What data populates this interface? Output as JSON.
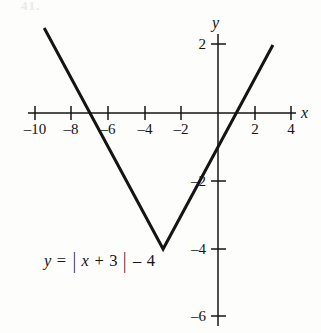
{
  "figure": {
    "background_color": "#fdfdfc",
    "ink_color": "#141414",
    "corner_mark": "41.",
    "width": 321,
    "height": 333
  },
  "axes": {
    "x_axis_name": "x",
    "y_axis_name": "y",
    "x_tick_labels": [
      "–10",
      "–8",
      "–6",
      "–4",
      "–2",
      "2",
      "4"
    ],
    "y_tick_labels": [
      "2",
      "–2",
      "–4",
      "–6"
    ]
  },
  "equation": {
    "lhs": "y",
    "equals": "=",
    "bar_open": "|",
    "inside_var": "x",
    "inside_op": "+",
    "inside_num": "3",
    "bar_close": "|",
    "trailing_op": "–",
    "trailing_num": "4",
    "full_text": "y = |x + 3| – 4"
  },
  "chart_data": {
    "type": "line",
    "title": "",
    "subtitle": "",
    "xlabel": "x",
    "ylabel": "y",
    "function": "y = |x + 3| - 4",
    "xlim": [
      -10.4,
      4.2
    ],
    "ylim": [
      -6.5,
      2.6
    ],
    "xticks": [
      -10,
      -8,
      -6,
      -4,
      -2,
      2,
      4
    ],
    "yticks": [
      2,
      -2,
      -4,
      -6
    ],
    "grid": false,
    "legend_position": "none",
    "annotations": [
      {
        "text": "y = |x + 3| – 4",
        "x": -8.3,
        "y": -4.3
      }
    ],
    "series": [
      {
        "name": "y = |x + 3| - 4",
        "x": [
          -9.5,
          -3,
          3
        ],
        "values": [
          2.5,
          -4,
          2
        ],
        "vertex": {
          "x": -3,
          "y": -4
        },
        "x_intercepts": [
          -7,
          1
        ],
        "y_intercept": -1,
        "slope_left": -1,
        "slope_right": 1,
        "color": "#141414"
      }
    ]
  }
}
